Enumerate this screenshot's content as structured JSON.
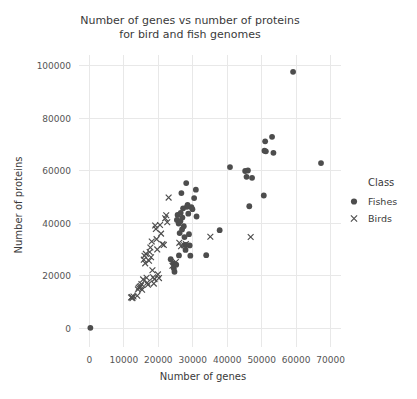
{
  "chart_data": {
    "type": "scatter",
    "title": "Number of genes vs number of proteins for bird and fish genomes",
    "title_lines": [
      "Number of genes vs number of proteins",
      "for bird and fish genomes"
    ],
    "xlabel": "Number of genes",
    "ylabel": "Number of proteins",
    "xlim": [
      -3000,
      73000
    ],
    "ylim": [
      -7000,
      104000
    ],
    "xticks": [
      0,
      10000,
      20000,
      30000,
      40000,
      50000,
      60000,
      70000
    ],
    "xticklabels": [
      "0",
      "10000",
      "20000",
      "30000",
      "40000",
      "50000",
      "60000",
      "70000"
    ],
    "yticks": [
      0,
      20000,
      40000,
      60000,
      80000,
      100000
    ],
    "yticklabels": [
      "0",
      "20000",
      "40000",
      "60000",
      "80000",
      "100000"
    ],
    "grid": true,
    "legend": {
      "title": "Class",
      "position": "right",
      "entries": [
        {
          "label": "Fishes",
          "marker": "circle",
          "color": "#4d4d4d"
        },
        {
          "label": "Birds",
          "marker": "x",
          "color": "#4d4d4d"
        }
      ]
    },
    "marker_color": "#4d4d4d",
    "grid_color": "#e8e8e8",
    "background_color": "#ffffff",
    "series": [
      {
        "name": "Fishes",
        "marker": "circle",
        "points": [
          [
            300,
            300
          ],
          [
            23600,
            26400
          ],
          [
            24300,
            24800
          ],
          [
            24500,
            22900
          ],
          [
            24700,
            21600
          ],
          [
            25200,
            24300
          ],
          [
            25400,
            41300
          ],
          [
            25600,
            43200
          ],
          [
            25900,
            39900
          ],
          [
            26000,
            27800
          ],
          [
            26200,
            36300
          ],
          [
            26400,
            40800
          ],
          [
            26500,
            44000
          ],
          [
            26700,
            51500
          ],
          [
            26900,
            37700
          ],
          [
            27000,
            42200
          ],
          [
            27200,
            45700
          ],
          [
            27400,
            38900
          ],
          [
            27600,
            34800
          ],
          [
            27800,
            31800
          ],
          [
            27900,
            29900
          ],
          [
            28100,
            55300
          ],
          [
            28300,
            46300
          ],
          [
            28500,
            47000
          ],
          [
            28700,
            43700
          ],
          [
            28900,
            35900
          ],
          [
            29100,
            31600
          ],
          [
            29300,
            27700
          ],
          [
            29600,
            46200
          ],
          [
            29900,
            45400
          ],
          [
            30400,
            49600
          ],
          [
            30900,
            52800
          ],
          [
            31100,
            42600
          ],
          [
            33900,
            27900
          ],
          [
            37800,
            37400
          ],
          [
            40800,
            61400
          ],
          [
            45200,
            59900
          ],
          [
            45600,
            57700
          ],
          [
            46000,
            60100
          ],
          [
            46400,
            46500
          ],
          [
            47200,
            57300
          ],
          [
            50600,
            50600
          ],
          [
            50800,
            67600
          ],
          [
            51000,
            71200
          ],
          [
            51200,
            67400
          ],
          [
            53000,
            72900
          ],
          [
            53400,
            66800
          ],
          [
            59100,
            97600
          ],
          [
            67200,
            62900
          ]
        ]
      },
      {
        "name": "Birds",
        "marker": "x",
        "points": [
          [
            12100,
            11800
          ],
          [
            12300,
            12000
          ],
          [
            12500,
            11600
          ],
          [
            12800,
            12200
          ],
          [
            13900,
            12500
          ],
          [
            14100,
            14900
          ],
          [
            14300,
            15500
          ],
          [
            14600,
            15900
          ],
          [
            14900,
            16200
          ],
          [
            15100,
            16900
          ],
          [
            15300,
            14800
          ],
          [
            15600,
            18700
          ],
          [
            15800,
            26200
          ],
          [
            16000,
            27700
          ],
          [
            16200,
            24800
          ],
          [
            16400,
            28400
          ],
          [
            16600,
            19300
          ],
          [
            16800,
            17400
          ],
          [
            17000,
            16700
          ],
          [
            17300,
            25800
          ],
          [
            17500,
            29100
          ],
          [
            17700,
            30800
          ],
          [
            17900,
            27100
          ],
          [
            18100,
            33100
          ],
          [
            18300,
            22200
          ],
          [
            18500,
            19500
          ],
          [
            18700,
            17100
          ],
          [
            18900,
            18800
          ],
          [
            19100,
            39200
          ],
          [
            19300,
            37900
          ],
          [
            19500,
            34000
          ],
          [
            19700,
            30100
          ],
          [
            19900,
            20600
          ],
          [
            20200,
            19200
          ],
          [
            20500,
            39400
          ],
          [
            20800,
            36100
          ],
          [
            21200,
            32100
          ],
          [
            21600,
            31800
          ],
          [
            22000,
            41900
          ],
          [
            22300,
            43100
          ],
          [
            22600,
            40400
          ],
          [
            23000,
            49800
          ],
          [
            24100,
            23900
          ],
          [
            25100,
            25300
          ],
          [
            26100,
            32600
          ],
          [
            26600,
            31300
          ],
          [
            27500,
            31700
          ],
          [
            28000,
            32100
          ],
          [
            35100,
            34900
          ],
          [
            46800,
            34800
          ]
        ]
      }
    ]
  }
}
